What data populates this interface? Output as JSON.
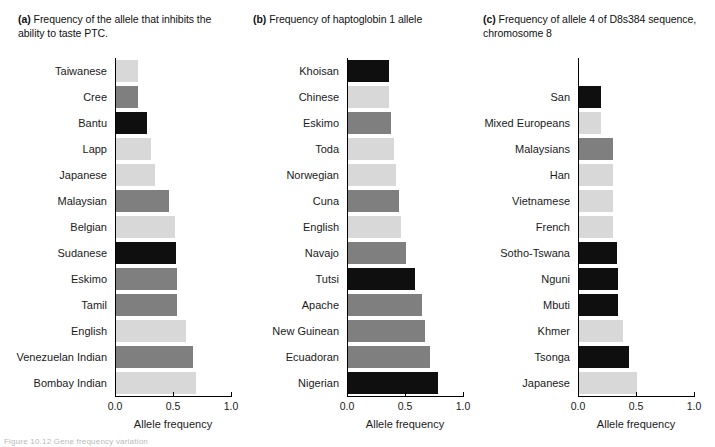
{
  "figure": {
    "caption": "Figure 10.12  Gene frequency variation",
    "bar_colors": {
      "light": "#d8d8d8",
      "medium": "#7f7f7f",
      "dark": "#100f0f"
    }
  },
  "chart_data": [
    {
      "type": "bar",
      "panel": "a",
      "panel_letter": "(a)",
      "title": "Frequency of the allele that inhibits the ability to taste PTC.",
      "xlabel": "Allele frequency",
      "ylabel": "",
      "xlim": [
        0.0,
        1.0
      ],
      "ticks": [
        "0.0",
        "0.5",
        "1.0"
      ],
      "tick_values": [
        0.0,
        0.5,
        1.0
      ],
      "grid": false,
      "orientation": "horizontal",
      "categories": [
        "Taiwanese",
        "Cree",
        "Bantu",
        "Lapp",
        "Japanese",
        "Malaysian",
        "Belgian",
        "Sudanese",
        "Eskimo",
        "Tamil",
        "English",
        "Venezuelan Indian",
        "Bombay Indian"
      ],
      "values": [
        0.19,
        0.19,
        0.27,
        0.3,
        0.34,
        0.46,
        0.51,
        0.52,
        0.53,
        0.53,
        0.6,
        0.66,
        0.69
      ],
      "shades": [
        "light",
        "medium",
        "dark",
        "light",
        "light",
        "medium",
        "light",
        "dark",
        "medium",
        "medium",
        "light",
        "medium",
        "light"
      ]
    },
    {
      "type": "bar",
      "panel": "b",
      "panel_letter": "(b)",
      "title": "Frequency of haptoglobin 1 allele",
      "xlabel": "Allele frequency",
      "ylabel": "",
      "xlim": [
        0.0,
        1.0
      ],
      "ticks": [
        "0.0",
        "0.5",
        "1.0"
      ],
      "tick_values": [
        0.0,
        0.5,
        1.0
      ],
      "grid": false,
      "orientation": "horizontal",
      "categories": [
        "Khoisan",
        "Chinese",
        "Eskimo",
        "Toda",
        "Norwegian",
        "Cuna",
        "English",
        "Navajo",
        "Tutsi",
        "Apache",
        "New Guinean",
        "Ecuadoran",
        "Nigerian"
      ],
      "values": [
        0.35,
        0.35,
        0.37,
        0.4,
        0.41,
        0.44,
        0.46,
        0.5,
        0.58,
        0.64,
        0.66,
        0.71,
        0.78
      ],
      "shades": [
        "dark",
        "light",
        "medium",
        "light",
        "light",
        "medium",
        "light",
        "medium",
        "dark",
        "medium",
        "medium",
        "medium",
        "dark"
      ]
    },
    {
      "type": "bar",
      "panel": "c",
      "panel_letter": "(c)",
      "title": "Frequency of allele 4 of D8s384 sequence, chromosome 8",
      "xlabel": "Allele frequency",
      "ylabel": "",
      "xlim": [
        0.0,
        1.0
      ],
      "ticks": [
        "0.0",
        "0.5",
        "1.0"
      ],
      "tick_values": [
        0.0,
        0.5,
        1.0
      ],
      "grid": false,
      "orientation": "horizontal",
      "categories": [
        "San",
        "Mixed Europeans",
        "Malaysians",
        "Han",
        "Vietnamese",
        "French",
        "Sotho-Tswana",
        "Nguni",
        "Mbuti",
        "Khmer",
        "Tsonga",
        "Japanese"
      ],
      "values": [
        0.19,
        0.19,
        0.29,
        0.29,
        0.29,
        0.29,
        0.33,
        0.34,
        0.34,
        0.38,
        0.43,
        0.5
      ],
      "shades": [
        "dark",
        "light",
        "medium",
        "light",
        "light",
        "light",
        "dark",
        "dark",
        "dark",
        "light",
        "dark",
        "light"
      ]
    }
  ]
}
